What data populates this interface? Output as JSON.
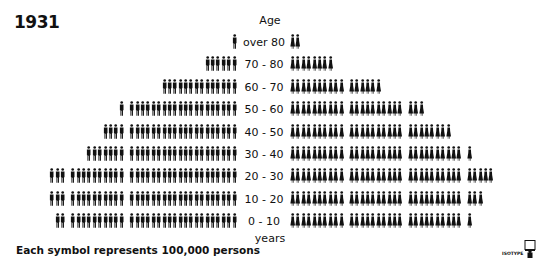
{
  "title": "1931",
  "age_header": "Age",
  "age_footer": "years",
  "legend": "Each symbol represents 100,000 persons",
  "logo_text": "ISOTYPE",
  "colors": {
    "symbol": "#111111",
    "background": "#ffffff"
  },
  "chart_data": {
    "type": "bar",
    "subtype": "population-pyramid-isotype",
    "title": "1931",
    "unit": "Each symbol represents 100,000 persons",
    "xlabel": "",
    "ylabel": "Age (years)",
    "categories": [
      "over 80",
      "70-80",
      "60-70",
      "50-60",
      "40-50",
      "30-40",
      "20-30",
      "10-20",
      "0-10"
    ],
    "series": [
      {
        "name": "Men",
        "side": "left",
        "symbol": "man",
        "values": [
          1,
          6,
          14,
          21,
          24,
          27,
          33,
          33,
          32
        ]
      },
      {
        "name": "Women",
        "side": "right",
        "symbol": "woman",
        "values": [
          2,
          8,
          16,
          23,
          28,
          31,
          35,
          33,
          31
        ]
      }
    ],
    "group_size": 10
  },
  "rows": [
    {
      "label": "over 80",
      "men": 1,
      "women": 2
    },
    {
      "label": "70 - 80",
      "men": 6,
      "women": 8
    },
    {
      "label": "60 - 70",
      "men": 14,
      "women": 16
    },
    {
      "label": "50 - 60",
      "men": 21,
      "women": 23
    },
    {
      "label": "40 - 50",
      "men": 24,
      "women": 28
    },
    {
      "label": "30 - 40",
      "men": 27,
      "women": 31
    },
    {
      "label": "20 - 30",
      "men": 33,
      "women": 35
    },
    {
      "label": "10 - 20",
      "men": 33,
      "women": 33
    },
    {
      "label": "0 - 10",
      "men": 32,
      "women": 31
    }
  ]
}
